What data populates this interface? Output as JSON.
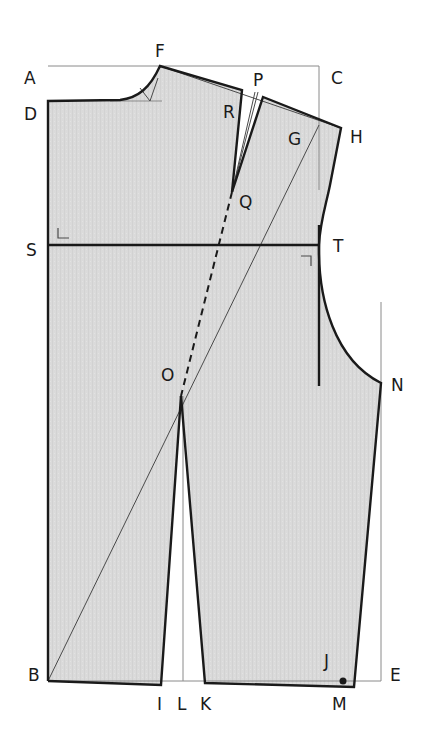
{
  "diagram": {
    "colors": {
      "fill": "#d9d9d9",
      "outline": "#1a1a1a",
      "construction": "#8a8a8a",
      "background": "#ffffff"
    },
    "points": {
      "A": "A",
      "B": "B",
      "C": "C",
      "D": "D",
      "E": "E",
      "F": "F",
      "G": "G",
      "H": "H",
      "I": "I",
      "J": "J",
      "K": "K",
      "L": "L",
      "M": "M",
      "N": "N",
      "O": "O",
      "P": "P",
      "Q": "Q",
      "R": "R",
      "S": "S",
      "T": "T"
    },
    "lines": {
      "frame": "Rectangle A-C-E-B (construction)",
      "chest_line": "S-T",
      "diagonal": "B-G",
      "dart_guide": "Q-O (dashed)",
      "shoulder_dart": "R-Q-P",
      "waist_dart": "I-O-K",
      "center_line": "L"
    }
  }
}
